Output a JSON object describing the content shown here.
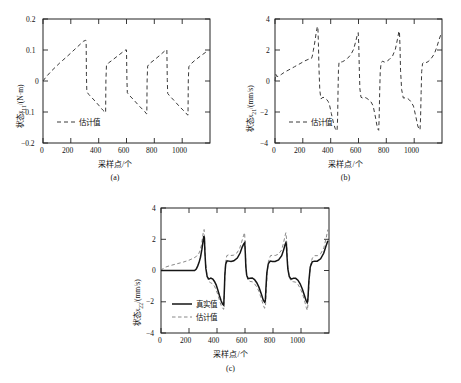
{
  "figure": {
    "panels": [
      {
        "id": "a",
        "caption": "(a)",
        "xlabel": "采样点/个",
        "ylabel_main": "状态",
        "ylabel_var": "x",
        "ylabel_sub": "11",
        "ylabel_unit": "/(N·m)",
        "ylabel_full": "状态x11/(N·m)",
        "legend": [
          {
            "label": "估计值",
            "style": "dashed"
          }
        ]
      },
      {
        "id": "b",
        "caption": "(b)",
        "xlabel": "采样点/个",
        "ylabel_main": "状态",
        "ylabel_var": "x",
        "ylabel_sub": "21",
        "ylabel_unit": "/(mm/s)",
        "ylabel_full": "状态x21/(mm/s)",
        "legend": [
          {
            "label": "估计值",
            "style": "dashed"
          }
        ]
      },
      {
        "id": "c",
        "caption": "(c)",
        "xlabel": "采样点/个",
        "ylabel_main": "状态",
        "ylabel_var": "x",
        "ylabel_sub": "22",
        "ylabel_unit": "/(mm/s)",
        "ylabel_full": "状态x22/(mm/s)",
        "legend": [
          {
            "label": "真实值",
            "style": "solid"
          },
          {
            "label": "估计值",
            "style": "dashed"
          }
        ]
      }
    ]
  },
  "chart_data": [
    {
      "type": "line",
      "panel": "a",
      "title": "",
      "xlabel": "采样点/个",
      "ylabel": "状态x11/(N·m)",
      "xlim": [
        0,
        1200
      ],
      "ylim": [
        -0.2,
        0.2
      ],
      "xticks": [
        0,
        200,
        400,
        600,
        800,
        1000
      ],
      "yticks": [
        -0.2,
        -0.1,
        0,
        0.1,
        0.2
      ],
      "grid": false,
      "legend_position": "lower-left",
      "series": [
        {
          "name": "估计值",
          "style": "dashed",
          "color": "#3a3a3a",
          "x": [
            0,
            20,
            60,
            120,
            180,
            240,
            290,
            305,
            310,
            312,
            315,
            330,
            360,
            400,
            430,
            448,
            450,
            452,
            456,
            470,
            500,
            540,
            580,
            598,
            600,
            603,
            606,
            620,
            650,
            690,
            730,
            744,
            746,
            748,
            752,
            765,
            800,
            840,
            875,
            888,
            890,
            893,
            896,
            910,
            940,
            980,
            1020,
            1040,
            1042,
            1044,
            1048,
            1060,
            1090,
            1130,
            1170,
            1190
          ],
          "y": [
            0.0,
            0.012,
            0.032,
            0.058,
            0.082,
            0.107,
            0.128,
            0.131,
            0.13,
            0.02,
            -0.035,
            -0.044,
            -0.058,
            -0.078,
            -0.094,
            -0.102,
            -0.102,
            0.0,
            0.05,
            0.058,
            0.068,
            0.082,
            0.096,
            0.101,
            0.1,
            0.005,
            -0.038,
            -0.046,
            -0.06,
            -0.08,
            -0.098,
            -0.106,
            -0.106,
            0.0,
            0.048,
            0.056,
            0.068,
            0.083,
            0.097,
            0.101,
            0.1,
            0.005,
            -0.04,
            -0.048,
            -0.062,
            -0.082,
            -0.1,
            -0.11,
            -0.11,
            0.0,
            0.046,
            0.054,
            0.066,
            0.08,
            0.093,
            0.097
          ]
        }
      ]
    },
    {
      "type": "line",
      "panel": "b",
      "title": "",
      "xlabel": "采样点/个",
      "ylabel": "状态x21/(mm/s)",
      "xlim": [
        0,
        1200
      ],
      "ylim": [
        -4,
        4
      ],
      "xticks": [
        0,
        200,
        400,
        600,
        800,
        1000
      ],
      "yticks": [
        -4,
        -2,
        0,
        2,
        4
      ],
      "grid": false,
      "legend_position": "lower-left",
      "series": [
        {
          "name": "估计值",
          "style": "dashed",
          "color": "#3a3a3a",
          "x": [
            0,
            5,
            12,
            25,
            45,
            70,
            100,
            140,
            180,
            215,
            245,
            262,
            268,
            275,
            285,
            295,
            303,
            308,
            312,
            316,
            322,
            330,
            345,
            360,
            372,
            382,
            392,
            405,
            420,
            432,
            440,
            446,
            450,
            453,
            456,
            460,
            466,
            474,
            486,
            500,
            520,
            545,
            565,
            580,
            592,
            598,
            602,
            606,
            610,
            618,
            630,
            645,
            660,
            675,
            690,
            705,
            720,
            732,
            740,
            745,
            748,
            752,
            756,
            762,
            772,
            786,
            800,
            820,
            845,
            865,
            880,
            890,
            894,
            898,
            902,
            910,
            922,
            938,
            952,
            966,
            980,
            995,
            1012,
            1026,
            1036,
            1042,
            1046,
            1050,
            1054,
            1060,
            1070,
            1084,
            1100,
            1120,
            1145,
            1165,
            1180,
            1192
          ],
          "y": [
            0.0,
            0.45,
            0.3,
            0.3,
            0.42,
            0.58,
            0.72,
            0.92,
            1.12,
            1.3,
            1.42,
            1.45,
            1.6,
            1.95,
            2.45,
            3.05,
            3.45,
            3.52,
            2.4,
            0.8,
            -0.6,
            -1.15,
            -1.05,
            -1.1,
            -1.2,
            -1.32,
            -1.55,
            -2.1,
            -2.7,
            -3.05,
            -3.18,
            -3.22,
            -2.4,
            -0.6,
            0.7,
            1.18,
            1.25,
            1.22,
            1.25,
            1.32,
            1.45,
            1.7,
            2.05,
            2.55,
            3.0,
            3.12,
            2.3,
            0.7,
            -0.5,
            -1.05,
            -1.1,
            -1.05,
            -1.12,
            -1.22,
            -1.35,
            -1.6,
            -2.25,
            -2.85,
            -3.12,
            -3.18,
            -2.5,
            -0.8,
            0.55,
            1.15,
            1.28,
            1.22,
            1.25,
            1.38,
            1.62,
            2.05,
            2.7,
            3.18,
            3.22,
            2.3,
            0.7,
            -0.55,
            -1.1,
            -1.08,
            -1.12,
            -1.22,
            -1.38,
            -1.62,
            -2.3,
            -2.9,
            -3.12,
            -3.15,
            -2.4,
            -0.75,
            0.6,
            1.12,
            1.22,
            1.18,
            1.25,
            1.42,
            1.75,
            2.25,
            2.7,
            3.0
          ]
        }
      ]
    },
    {
      "type": "line",
      "panel": "c",
      "title": "",
      "xlabel": "采样点/个",
      "ylabel": "状态x22/(mm/s)",
      "xlim": [
        0,
        1200
      ],
      "ylim": [
        -4,
        4
      ],
      "xticks": [
        0,
        200,
        400,
        600,
        800,
        1000
      ],
      "yticks": [
        -4,
        -2,
        0,
        2,
        4
      ],
      "grid": false,
      "legend_position": "lower-left",
      "series": [
        {
          "name": "真实值",
          "style": "solid",
          "color": "#151515",
          "x": [
            0,
            40,
            100,
            160,
            210,
            240,
            252,
            262,
            272,
            282,
            292,
            300,
            306,
            310,
            314,
            320,
            330,
            342,
            356,
            370,
            382,
            394,
            406,
            418,
            430,
            440,
            448,
            452,
            456,
            462,
            472,
            486,
            500,
            520,
            545,
            565,
            580,
            592,
            598,
            602,
            606,
            612,
            622,
            636,
            652,
            668,
            684,
            700,
            716,
            730,
            740,
            745,
            750,
            756,
            766,
            780,
            796,
            815,
            840,
            862,
            876,
            886,
            892,
            896,
            900,
            906,
            916,
            930,
            946,
            962,
            978,
            994,
            1010,
            1024,
            1036,
            1044,
            1050,
            1056,
            1066,
            1080,
            1096,
            1116,
            1140,
            1162,
            1178,
            1192
          ],
          "y": [
            0.0,
            0.0,
            0.0,
            0.0,
            0.0,
            0.0,
            0.1,
            0.28,
            0.52,
            0.85,
            1.35,
            1.85,
            2.2,
            2.1,
            1.1,
            0.15,
            -0.4,
            -0.55,
            -0.48,
            -0.55,
            -0.7,
            -0.92,
            -1.25,
            -1.62,
            -1.95,
            -2.15,
            -2.22,
            -1.4,
            -0.3,
            0.4,
            0.62,
            0.6,
            0.58,
            0.62,
            0.8,
            1.12,
            1.5,
            1.72,
            1.78,
            1.15,
            0.25,
            -0.3,
            -0.52,
            -0.5,
            -0.48,
            -0.58,
            -0.78,
            -1.08,
            -1.48,
            -1.88,
            -2.02,
            -1.95,
            -1.05,
            -0.15,
            0.42,
            0.6,
            0.58,
            0.58,
            0.68,
            0.95,
            1.32,
            1.65,
            1.78,
            1.62,
            0.9,
            0.1,
            -0.38,
            -0.55,
            -0.5,
            -0.5,
            -0.62,
            -0.85,
            -1.2,
            -1.58,
            -1.92,
            -2.05,
            -1.75,
            -0.7,
            0.22,
            0.55,
            0.6,
            0.6,
            0.75,
            1.1,
            1.55,
            1.9
          ]
        },
        {
          "name": "估计值",
          "style": "dashed",
          "color": "#7a7a7a",
          "x": [
            0,
            20,
            60,
            110,
            160,
            200,
            235,
            255,
            268,
            278,
            288,
            296,
            302,
            308,
            312,
            318,
            328,
            340,
            354,
            368,
            382,
            394,
            406,
            418,
            430,
            440,
            448,
            452,
            456,
            462,
            470,
            482,
            498,
            518,
            542,
            562,
            578,
            590,
            597,
            602,
            606,
            612,
            622,
            636,
            652,
            668,
            684,
            700,
            716,
            730,
            740,
            746,
            752,
            758,
            768,
            782,
            798,
            816,
            840,
            862,
            876,
            886,
            892,
            897,
            901,
            907,
            917,
            931,
            947,
            963,
            979,
            995,
            1011,
            1025,
            1037,
            1045,
            1051,
            1057,
            1067,
            1081,
            1097,
            1117,
            1141,
            1163,
            1179,
            1192
          ],
          "y": [
            0.0,
            0.18,
            0.3,
            0.42,
            0.54,
            0.66,
            0.8,
            0.92,
            1.05,
            1.25,
            1.6,
            2.05,
            2.45,
            2.62,
            1.75,
            0.55,
            -0.3,
            -0.7,
            -0.78,
            -0.85,
            -1.0,
            -1.25,
            -1.55,
            -1.92,
            -2.25,
            -2.42,
            -2.48,
            -1.55,
            -0.35,
            0.55,
            0.95,
            1.0,
            0.96,
            0.98,
            1.12,
            1.42,
            1.88,
            2.25,
            2.42,
            1.55,
            0.4,
            -0.3,
            -0.62,
            -0.7,
            -0.72,
            -0.85,
            -1.05,
            -1.35,
            -1.78,
            -2.2,
            -2.42,
            -2.3,
            -1.25,
            -0.2,
            0.62,
            0.95,
            0.98,
            0.96,
            1.05,
            1.32,
            1.8,
            2.22,
            2.42,
            2.0,
            1.05,
            0.12,
            -0.45,
            -0.7,
            -0.72,
            -0.75,
            -0.9,
            -1.15,
            -1.5,
            -1.92,
            -2.35,
            -2.55,
            -2.1,
            -0.85,
            0.3,
            0.8,
            0.95,
            0.95,
            1.08,
            1.45,
            2.05,
            2.62
          ]
        }
      ]
    }
  ]
}
